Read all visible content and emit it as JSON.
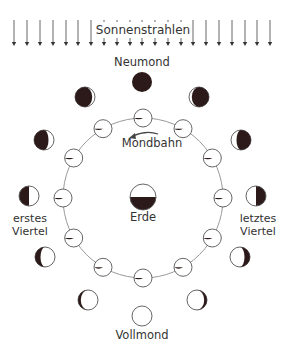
{
  "colors": {
    "dark": "#2b1a19",
    "light": "#ffffff",
    "outline": "#555555",
    "orbit": "#9a9a9a",
    "arrow": "#444444",
    "text": "#333333"
  },
  "sun": {
    "label": "Sonnenstrahlen",
    "arrow_x": [
      14,
      27,
      40,
      53,
      66,
      78,
      91,
      104,
      117,
      130,
      142,
      155,
      168,
      181,
      193,
      206,
      219,
      232,
      245,
      257,
      270
    ],
    "arrow_top": 20,
    "arrow_bottom": 46
  },
  "labels": {
    "new_moon": "Neumond",
    "orbit": "Mondbahn",
    "earth": "Erde",
    "first_quarter_1": "erstes",
    "first_quarter_2": "Viertel",
    "last_quarter_1": "letztes",
    "last_quarter_2": "Viertel",
    "full_moon": "Vollmond"
  },
  "earth": {
    "cx": 143,
    "cy": 197,
    "r": 13
  },
  "orbit": {
    "cx": 143,
    "cy": 198,
    "r": 80,
    "moon_r": 9,
    "count": 12
  },
  "outer_phases": [
    {
      "name": "Neumond",
      "cx": 142,
      "cy": 82,
      "lit": "none"
    },
    {
      "name": "zunehmende Sichel",
      "cx": 85,
      "cy": 97,
      "lit": "right-thin"
    },
    {
      "name": "zunehmende Sichel 2",
      "cx": 44,
      "cy": 140,
      "lit": "right-crescent"
    },
    {
      "name": "erstes Viertel",
      "cx": 29,
      "cy": 196,
      "lit": "right-half"
    },
    {
      "name": "zunehmender Mond",
      "cx": 45,
      "cy": 257,
      "lit": "left-gibbous-dark-left"
    },
    {
      "name": "fast Vollmond zunehmend",
      "cx": 88,
      "cy": 300,
      "lit": "dark-left-thin"
    },
    {
      "name": "Vollmond",
      "cx": 142,
      "cy": 316,
      "lit": "full"
    },
    {
      "name": "fast Vollmond abnehmend",
      "cx": 197,
      "cy": 300,
      "lit": "dark-right-thin"
    },
    {
      "name": "abnehmender Mond",
      "cx": 240,
      "cy": 257,
      "lit": "dark-right-gibbous"
    },
    {
      "name": "letztes Viertel",
      "cx": 256,
      "cy": 196,
      "lit": "left-half"
    },
    {
      "name": "abnehmende Sichel 2",
      "cx": 241,
      "cy": 140,
      "lit": "left-crescent"
    },
    {
      "name": "abnehmende Sichel",
      "cx": 199,
      "cy": 97,
      "lit": "left-thin"
    }
  ]
}
